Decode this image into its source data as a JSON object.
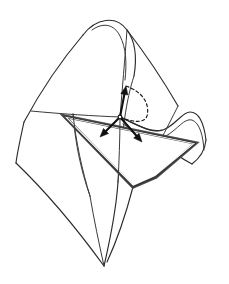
{
  "figure": {
    "kind": "line-drawing",
    "title": "",
    "caption": "",
    "background_color": "#ffffff",
    "ink_color": "#2b2b2b",
    "canvas": {
      "width": 229,
      "height": 284
    }
  },
  "geometry": {
    "base_point": {
      "x": 120,
      "y": 117,
      "label": ""
    },
    "vectors": [
      {
        "name": "normal-vector",
        "from": {
          "x": 120,
          "y": 117
        },
        "to": {
          "x": 126,
          "y": 86
        },
        "direction": "up",
        "label": ""
      },
      {
        "name": "tangent-vector-left",
        "from": {
          "x": 120,
          "y": 117
        },
        "to": {
          "x": 100,
          "y": 137
        },
        "direction": "down-left",
        "label": ""
      },
      {
        "name": "tangent-vector-right",
        "from": {
          "x": 120,
          "y": 117
        },
        "to": {
          "x": 142,
          "y": 142
        },
        "direction": "down-right",
        "label": ""
      }
    ],
    "dashed_arc": {
      "name": "normal-section-arc",
      "from": {
        "x": 126,
        "y": 86
      },
      "to": {
        "x": 120,
        "y": 117
      },
      "style": "dashed"
    },
    "tangent_plane": {
      "name": "tangent-plane",
      "rendering": "edge-on-wedge",
      "corners": [
        {
          "x": 64,
          "y": 116
        },
        {
          "x": 196,
          "y": 143
        },
        {
          "x": 156,
          "y": 177
        },
        {
          "x": 133,
          "y": 187
        }
      ],
      "edge_color": "#4a4a4a"
    }
  },
  "legend": {
    "entries": []
  },
  "annotations": {
    "labels": []
  }
}
